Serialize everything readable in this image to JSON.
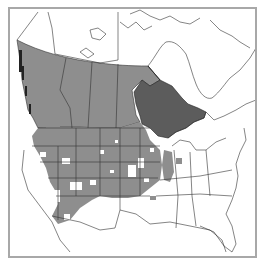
{
  "map": {
    "type": "distribution-range-map",
    "region": "North America (Canada, United States, northern Mexico)",
    "colors": {
      "background": "#ffffff",
      "frame": "#a8a8a8",
      "boundary": "#333333",
      "range_medium": "#8e8e8e",
      "range_dark": "#5c5c5c",
      "water": "#ffffff"
    },
    "legend": [],
    "shaded_regions": {
      "medium": [
        "British Columbia (southern)",
        "Alberta (southern)",
        "Saskatchewan (southern)",
        "Manitoba (southern)",
        "Great Plains states",
        "Rocky Mountain states (patchy)",
        "Illinois"
      ],
      "dark": [
        "Ontario (southern/central)"
      ]
    }
  }
}
